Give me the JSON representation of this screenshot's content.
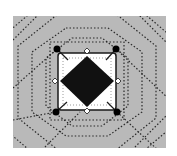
{
  "diagram": {
    "title": "",
    "background_color": "#ffffff",
    "panel": {
      "x": 13,
      "y": 16,
      "width": 153,
      "height": 132,
      "fill": "#b9b9b9"
    },
    "nested_octagons": {
      "stroke": "#2a2a2a",
      "style": "dotted",
      "count": 4
    },
    "inner_square": {
      "x": 58,
      "y": 53,
      "width": 58,
      "height": 57,
      "fill": "#ffffff",
      "stroke": "#1a1a1a",
      "corner_radius": 3
    },
    "diamond": {
      "top": [
        87,
        56
      ],
      "right": [
        114,
        81
      ],
      "bottom": [
        87,
        107
      ],
      "left": [
        60,
        81
      ],
      "fill": "#111111"
    },
    "corner_dots": [
      {
        "name": "top-left",
        "cx": 57,
        "cy": 49
      },
      {
        "name": "top-right",
        "cx": 116,
        "cy": 49
      },
      {
        "name": "bottom-left",
        "cx": 56,
        "cy": 112
      },
      {
        "name": "bottom-right",
        "cx": 117,
        "cy": 112
      }
    ],
    "handle_markers": [
      {
        "name": "top",
        "cx": 87,
        "cy": 51
      },
      {
        "name": "right",
        "cx": 118,
        "cy": 81
      },
      {
        "name": "bottom",
        "cx": 87,
        "cy": 111
      },
      {
        "name": "left",
        "cx": 55,
        "cy": 81
      }
    ]
  }
}
